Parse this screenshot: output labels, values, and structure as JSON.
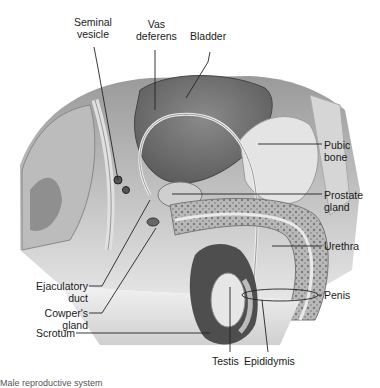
{
  "diagram": {
    "title": "Male reproductive system",
    "caption": "Male reproductive system",
    "style": "grayscale anatomical illustration, sagittal section",
    "labels": {
      "seminal_vesicle": "Seminal\nvesicle",
      "vas_deferens": "Vas\ndeferens",
      "bladder": "Bladder",
      "pubic_bone": "Pubic\nbone",
      "prostate_gland": "Prostate\ngland",
      "urethra": "Urethra",
      "penis": "Penis",
      "ejaculatory_duct": "Ejaculatory\nduct",
      "cowpers_gland": "Cowper's\ngland",
      "scrotum": "Scrotum",
      "testis": "Testis",
      "epididymis": "Epididymis"
    },
    "colors": {
      "background": "#ffffff",
      "tissue_dark": "#6e6e6e",
      "tissue_mid": "#a8a8a8",
      "tissue_light": "#d9d9d9",
      "leader_line": "#222222",
      "text": "#1a1a1a"
    }
  }
}
